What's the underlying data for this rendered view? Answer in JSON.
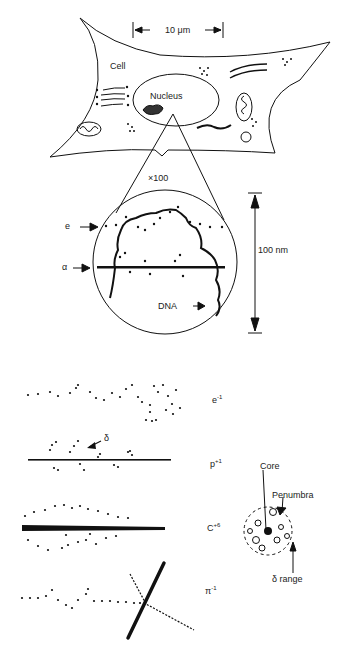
{
  "figure": {
    "cell": {
      "scale_bar_label": "10 μm",
      "cell_label": "Cell",
      "nucleus_label": "Nucleus"
    },
    "magnified": {
      "zoom_label": "×100",
      "track_labels": {
        "electron": "e",
        "alpha": "α"
      },
      "dna_label": "DNA",
      "scale_bar_label": "100 nm"
    },
    "tracks": [
      {
        "particle": "e",
        "charge": "-1"
      },
      {
        "particle": "p",
        "charge": "+1",
        "delta_label": "δ"
      },
      {
        "particle": "C",
        "charge": "+6"
      },
      {
        "particle": "π",
        "charge": "-1"
      }
    ],
    "cross_section": {
      "core_label": "Core",
      "penumbra_label": "Penumbra",
      "delta_range_label": "δ range"
    }
  }
}
